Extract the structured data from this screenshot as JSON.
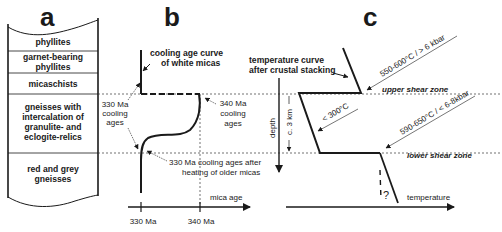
{
  "panels": {
    "a": {
      "letter": "a",
      "layers": [
        {
          "lines": [
            "phyllites"
          ]
        },
        {
          "lines": [
            "garnet-bearing",
            "phyllites"
          ]
        },
        {
          "lines": [
            "micaschists"
          ]
        },
        {
          "lines": [
            "gneisses with",
            "intercalation of",
            "granulite- and",
            "eclogite-relics"
          ]
        },
        {
          "lines": [
            "red and grey",
            "gneisses"
          ]
        }
      ]
    },
    "b": {
      "letter": "b",
      "curve_title": [
        "cooling age curve",
        "of white micas"
      ],
      "label_330_left": [
        "330 Ma",
        "cooling",
        "ages"
      ],
      "label_340": [
        "340 Ma",
        "cooling",
        "ages"
      ],
      "label_330_after": [
        "330 Ma cooling ages after",
        "heating of older micas"
      ],
      "x_axis_label": "mica age",
      "x_ticks": [
        "330 Ma",
        "340 Ma"
      ]
    },
    "c": {
      "letter": "c",
      "curve_title": [
        "temperature curve",
        "after crustal stacking"
      ],
      "upper_label": "550-600°C / > 6 kbar",
      "middle_label": "< 300°C",
      "lower_label": "590-650°C / < 6-8kbar",
      "upper_zone": "upper shear zone",
      "lower_zone": "lower shear zone",
      "depth_label": "depth",
      "thickness_label": "c. 3 km",
      "question_mark": "?",
      "x_axis_label": "temperature"
    }
  }
}
